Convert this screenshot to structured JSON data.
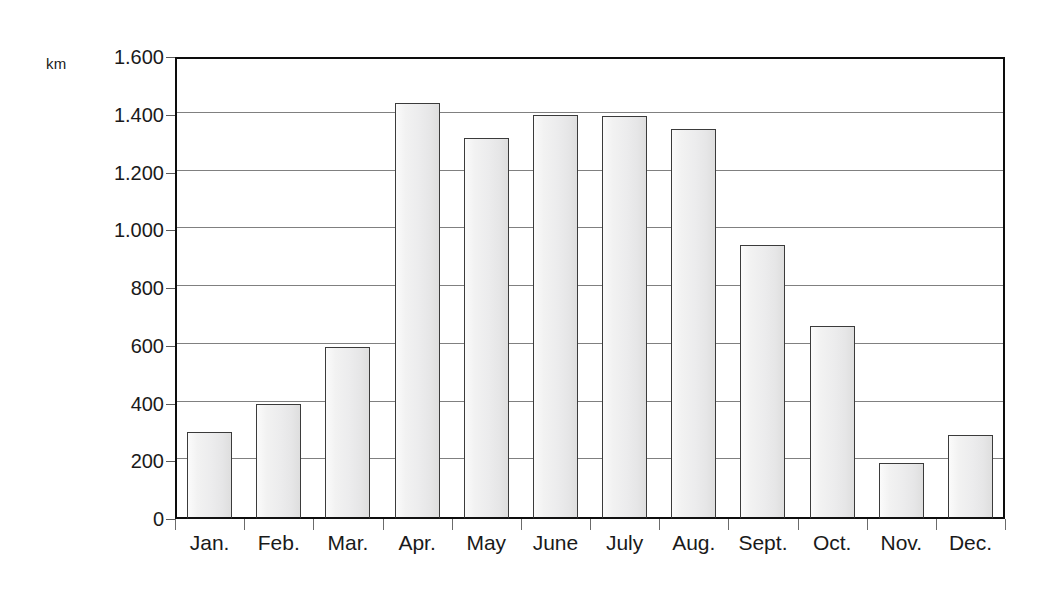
{
  "chart_data": {
    "type": "bar",
    "title": "",
    "xlabel": "",
    "ylabel": "km",
    "ylim": [
      0,
      1600
    ],
    "grid": true,
    "legend": false,
    "categories": [
      "Jan.",
      "Feb.",
      "Mar.",
      "Apr.",
      "May",
      "June",
      "July",
      "Aug.",
      "Sept.",
      "Oct.",
      "Nov.",
      "Dec."
    ],
    "values": [
      300,
      400,
      595,
      1440,
      1320,
      1400,
      1395,
      1350,
      950,
      670,
      195,
      290
    ],
    "y_ticks": [
      0,
      200,
      400,
      600,
      800,
      1000,
      1200,
      1400,
      1600
    ],
    "y_tick_labels": [
      "0",
      "200",
      "400",
      "600",
      "800",
      "1.000",
      "1.200",
      "1.400",
      "1.600"
    ]
  },
  "axes": {
    "unit_label": "km"
  },
  "colors": {
    "frame": "#0d0d0d",
    "gridline": "#808080",
    "bar_border": "#3b3b3b",
    "bar_fill_light": "#fbfbfb",
    "bar_fill_dark": "#dedede",
    "text": "#1a1a1a",
    "background": "#ffffff"
  }
}
